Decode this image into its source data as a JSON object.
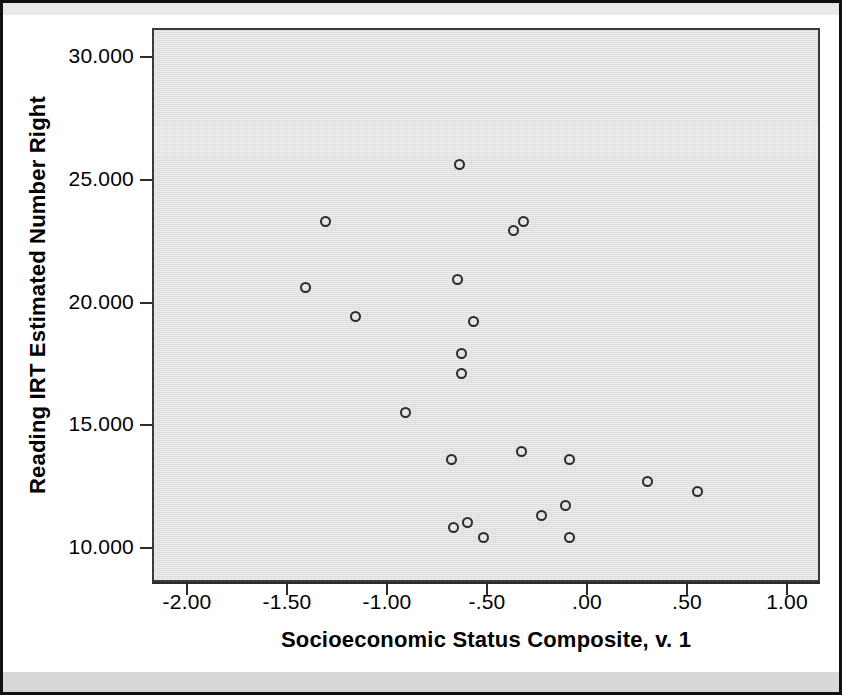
{
  "chart_data": {
    "type": "scatter",
    "title": "",
    "xlabel": "Socioeconomic Status Composite, v. 1",
    "ylabel": "Reading IRT Estimated Number Right",
    "xlim": [
      -2.25,
      1.18
    ],
    "ylim": [
      8.6,
      31.0
    ],
    "grid": false,
    "legend": null,
    "x_ticks": [
      -2.0,
      -1.5,
      -1.0,
      -0.5,
      0.0,
      0.5,
      1.0
    ],
    "x_tick_labels": [
      "-2.00",
      "-1.50",
      "-1.00",
      "-.50",
      ".00",
      ".50",
      "1.00"
    ],
    "y_ticks": [
      10.0,
      15.0,
      20.0,
      25.0,
      30.0
    ],
    "y_tick_labels": [
      "10.000",
      "15.000",
      "20.000",
      "25.000",
      "30.000"
    ],
    "marker": "open-circle",
    "marker_color": "#2b2b2b",
    "plot_background": "#d6d6d6",
    "points": [
      {
        "x": -0.65,
        "y": 25.7
      },
      {
        "x": -1.32,
        "y": 23.4
      },
      {
        "x": -0.33,
        "y": 23.4
      },
      {
        "x": -0.38,
        "y": 23.0
      },
      {
        "x": -1.42,
        "y": 20.7
      },
      {
        "x": -0.66,
        "y": 21.0
      },
      {
        "x": -1.17,
        "y": 19.5
      },
      {
        "x": -0.58,
        "y": 19.3
      },
      {
        "x": -0.64,
        "y": 18.0
      },
      {
        "x": -0.64,
        "y": 17.2
      },
      {
        "x": -0.92,
        "y": 15.6
      },
      {
        "x": -0.34,
        "y": 14.0
      },
      {
        "x": -0.69,
        "y": 13.7
      },
      {
        "x": -0.1,
        "y": 13.7
      },
      {
        "x": 0.29,
        "y": 12.8
      },
      {
        "x": 0.54,
        "y": 12.4
      },
      {
        "x": -0.12,
        "y": 11.8
      },
      {
        "x": -0.24,
        "y": 11.4
      },
      {
        "x": -0.61,
        "y": 11.1
      },
      {
        "x": -0.68,
        "y": 10.9
      },
      {
        "x": -0.53,
        "y": 10.5
      },
      {
        "x": -0.1,
        "y": 10.5
      }
    ]
  },
  "axes": {
    "x_title": "Socioeconomic Status Composite, v. 1",
    "y_title": "Reading IRT Estimated Number Right",
    "x_tick_labels": [
      "-2.00",
      "-1.50",
      "-1.00",
      "-.50",
      ".00",
      ".50",
      "1.00"
    ],
    "y_tick_labels": [
      "30.000",
      "25.000",
      "20.000",
      "15.000",
      "10.000"
    ]
  },
  "colors": {
    "plot_background": "#d6d6d6",
    "frame": "#3a3a3a",
    "marker": "#2b2b2b",
    "text": "#000000",
    "page_background": "#ffffff"
  }
}
